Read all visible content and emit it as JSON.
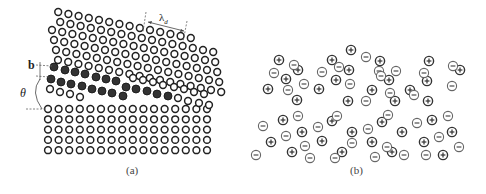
{
  "figure": {
    "panels": [
      {
        "id": "a",
        "caption": "(a)",
        "caption_pos": [
          130,
          170
        ],
        "description": "Low-angle grain boundary: tilted lattice over regular lattice with dislocation rows",
        "labels": {
          "b": "b",
          "theta": "θ",
          "lambda": "λ",
          "lambda_sub": "d"
        },
        "lower_grid": {
          "origin": [
            48,
            109
          ],
          "dx": 10.6,
          "dy": 10.3,
          "cols": 16,
          "rows": 5
        },
        "upper_grid": {
          "origin": [
            58,
            60
          ],
          "col_vec": [
            10.2,
            2.0
          ],
          "row_vec": [
            -2.0,
            -10.0
          ],
          "rows": [
            {
              "r": 0,
              "c0": 0,
              "c1": 17
            },
            {
              "r": 1,
              "c0": 0,
              "c1": 17
            },
            {
              "r": 2,
              "c0": 0,
              "c1": 17
            },
            {
              "r": 3,
              "c0": 0,
              "c1": 17
            },
            {
              "r": 4,
              "c0": 1,
              "c1": 17
            },
            {
              "r": 5,
              "c0": 1,
              "c1": 15
            }
          ]
        },
        "filled_atoms": [
          [
            54,
            67
          ],
          [
            65,
            70
          ],
          [
            75,
            72
          ],
          [
            85,
            74
          ],
          [
            96,
            77
          ],
          [
            106,
            79
          ],
          [
            116,
            81
          ],
          [
            51,
            79
          ],
          [
            61,
            82
          ],
          [
            71,
            84
          ],
          [
            82,
            86
          ],
          [
            92,
            89
          ],
          [
            102,
            91
          ],
          [
            112,
            93
          ],
          [
            123,
            96
          ],
          [
            126,
            87
          ],
          [
            136,
            89
          ],
          [
            147,
            91
          ],
          [
            157,
            94
          ],
          [
            168,
            96
          ]
        ],
        "row_between_open": [
          [
            50,
            89
          ],
          [
            60,
            92
          ],
          [
            70,
            94
          ],
          [
            80,
            97
          ]
        ],
        "open_between_right": [
          [
            133,
            78
          ],
          [
            143,
            80
          ],
          [
            153,
            82
          ],
          [
            163,
            85
          ],
          [
            174,
            87
          ],
          [
            184,
            89
          ],
          [
            194,
            92
          ],
          [
            204,
            94
          ],
          [
            178,
            98
          ],
          [
            188,
            101
          ],
          [
            199,
            103
          ],
          [
            209,
            105
          ]
        ],
        "atom_radius": 3.4,
        "colors": {
          "open_stroke": "#222222",
          "filled": "#333333",
          "dash": "#666666"
        }
      },
      {
        "id": "b",
        "caption": "(b)",
        "caption_pos": [
          354,
          170
        ],
        "description": "Ionic crystal with randomly arranged positive and negative ions",
        "ions": {
          "positive": [
            [
              279,
              60
            ],
            [
              286,
              79
            ],
            [
              268,
              89
            ],
            [
              298,
              70
            ],
            [
              297,
              100
            ],
            [
              332,
              60
            ],
            [
              336,
              80
            ],
            [
              319,
              89
            ],
            [
              349,
              70
            ],
            [
              348,
              101
            ],
            [
              351,
              50
            ],
            [
              380,
              61
            ],
            [
              389,
              80
            ],
            [
              372,
              90
            ],
            [
              395,
              101
            ],
            [
              429,
              61
            ],
            [
              427,
              81
            ],
            [
              410,
              90
            ],
            [
              428,
              101
            ],
            [
              460,
              70
            ],
            [
              283,
              120
            ],
            [
              271,
              142
            ],
            [
              302,
              132
            ],
            [
              292,
              152
            ],
            [
              332,
              121
            ],
            [
              322,
              141
            ],
            [
              352,
              132
            ],
            [
              342,
              152
            ],
            [
              382,
              122
            ],
            [
              372,
              142
            ],
            [
              402,
              132
            ],
            [
              392,
              152
            ],
            [
              432,
              120
            ],
            [
              424,
              142
            ],
            [
              452,
              132
            ],
            [
              443,
              155
            ]
          ],
          "negative": [
            [
              294,
              65
            ],
            [
              274,
              73
            ],
            [
              322,
              72
            ],
            [
              288,
              90
            ],
            [
              304,
              84
            ],
            [
              339,
              67
            ],
            [
              350,
              84
            ],
            [
              366,
              57
            ],
            [
              379,
              71
            ],
            [
              390,
              93
            ],
            [
              381,
              76
            ],
            [
              396,
              71
            ],
            [
              424,
              73
            ],
            [
              414,
              95
            ],
            [
              453,
              66
            ],
            [
              452,
              86
            ],
            [
              366,
              101
            ],
            [
              298,
              116
            ],
            [
              263,
              126
            ],
            [
              286,
              136
            ],
            [
              318,
              127
            ],
            [
              337,
              116
            ],
            [
              305,
              146
            ],
            [
              256,
              155
            ],
            [
              368,
              129
            ],
            [
              352,
              143
            ],
            [
              388,
              115
            ],
            [
              387,
              147
            ],
            [
              417,
              123
            ],
            [
              404,
              155
            ],
            [
              448,
              116
            ],
            [
              439,
              137
            ],
            [
              459,
              147
            ],
            [
              426,
              155
            ],
            [
              335,
              158
            ],
            [
              375,
              157
            ],
            [
              310,
              158
            ]
          ],
          "radius": 4.6,
          "colors": {
            "positive": "#333333",
            "negative": "#666666"
          },
          "positive_symbol": "+",
          "negative_symbol": "-"
        }
      }
    ]
  }
}
